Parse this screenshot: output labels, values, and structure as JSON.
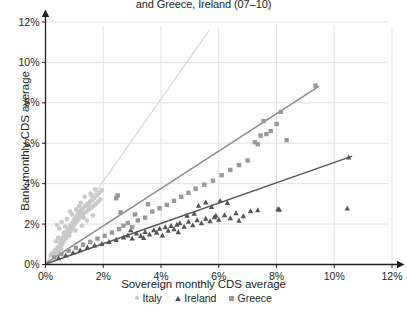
{
  "chart_data": {
    "type": "scatter",
    "title": "and Greece, Ireland (07–10)",
    "xlabel": "Sovereign monthly CDS average",
    "ylabel": "Bank monthly CDS average",
    "xlim": [
      0,
      12
    ],
    "ylim": [
      0,
      12
    ],
    "xticks": [
      "0%",
      "2%",
      "4%",
      "6%",
      "8%",
      "10%",
      "12%"
    ],
    "yticks": [
      "0%",
      "2%",
      "4%",
      "6%",
      "8%",
      "10%",
      "12%"
    ],
    "xtick_values": [
      0,
      2,
      4,
      6,
      8,
      10,
      12
    ],
    "ytick_values": [
      0,
      2,
      4,
      6,
      8,
      10,
      12
    ],
    "grid": true,
    "legend_position": "bottom",
    "axis_arrows": true,
    "colors": {
      "italy": "#c9c9c9",
      "ireland": "#555555",
      "greece": "#999999",
      "grid": "#e3e3e3",
      "axis": "#231f20",
      "text": "#231f20"
    },
    "series": [
      {
        "name": "Italy",
        "marker": "circle",
        "color": "#c9c9c9",
        "points": [
          [
            0.18,
            0.45
          ],
          [
            0.22,
            0.55
          ],
          [
            0.28,
            0.62
          ],
          [
            0.3,
            0.48
          ],
          [
            0.34,
            0.72
          ],
          [
            0.38,
            0.6
          ],
          [
            0.42,
            0.85
          ],
          [
            0.45,
            0.7
          ],
          [
            0.5,
            1.05
          ],
          [
            0.52,
            0.9
          ],
          [
            0.55,
            1.2
          ],
          [
            0.58,
            1.0
          ],
          [
            0.6,
            1.35
          ],
          [
            0.63,
            1.15
          ],
          [
            0.66,
            1.45
          ],
          [
            0.7,
            1.28
          ],
          [
            0.72,
            1.6
          ],
          [
            0.75,
            1.4
          ],
          [
            0.78,
            1.72
          ],
          [
            0.8,
            1.52
          ],
          [
            0.83,
            1.85
          ],
          [
            0.86,
            1.62
          ],
          [
            0.88,
            1.95
          ],
          [
            0.9,
            1.75
          ],
          [
            0.93,
            2.05
          ],
          [
            0.95,
            1.85
          ],
          [
            0.98,
            2.18
          ],
          [
            1.0,
            1.98
          ],
          [
            1.02,
            2.28
          ],
          [
            1.05,
            2.08
          ],
          [
            1.08,
            2.4
          ],
          [
            1.1,
            2.15
          ],
          [
            1.12,
            2.52
          ],
          [
            1.15,
            2.25
          ],
          [
            1.18,
            2.62
          ],
          [
            1.2,
            2.35
          ],
          [
            1.24,
            2.7
          ],
          [
            1.28,
            2.45
          ],
          [
            1.3,
            2.8
          ],
          [
            1.34,
            2.55
          ],
          [
            1.38,
            2.9
          ],
          [
            1.42,
            2.62
          ],
          [
            1.46,
            3.0
          ],
          [
            1.5,
            2.72
          ],
          [
            1.54,
            3.1
          ],
          [
            1.58,
            2.8
          ],
          [
            1.62,
            3.18
          ],
          [
            1.66,
            2.9
          ],
          [
            1.7,
            3.3
          ],
          [
            1.74,
            3.0
          ],
          [
            1.78,
            3.42
          ],
          [
            1.82,
            3.1
          ],
          [
            1.86,
            3.55
          ],
          [
            1.9,
            3.22
          ],
          [
            1.95,
            3.68
          ],
          [
            0.4,
            1.95
          ],
          [
            0.48,
            1.78
          ],
          [
            0.56,
            2.1
          ],
          [
            0.64,
            1.58
          ],
          [
            0.74,
            2.25
          ],
          [
            0.82,
            1.42
          ],
          [
            0.92,
            2.48
          ],
          [
            1.04,
            1.68
          ],
          [
            1.16,
            2.88
          ],
          [
            1.26,
            1.92
          ],
          [
            1.36,
            3.35
          ],
          [
            1.44,
            2.18
          ],
          [
            1.56,
            3.5
          ],
          [
            1.64,
            2.42
          ],
          [
            1.72,
            3.72
          ],
          [
            0.36,
            1.15
          ],
          [
            0.44,
            1.32
          ],
          [
            0.54,
            0.78
          ],
          [
            0.68,
            1.88
          ],
          [
            0.85,
            2.62
          ],
          [
            1.06,
            2.72
          ],
          [
            1.22,
            3.05
          ],
          [
            1.32,
            2.32
          ],
          [
            1.48,
            2.95
          ],
          [
            1.6,
            3.42
          ]
        ]
      },
      {
        "name": "Ireland",
        "marker": "triangle",
        "color": "#555555",
        "points": [
          [
            0.45,
            0.32
          ],
          [
            0.7,
            0.45
          ],
          [
            0.95,
            0.58
          ],
          [
            1.2,
            0.72
          ],
          [
            1.45,
            0.85
          ],
          [
            1.7,
            0.95
          ],
          [
            1.95,
            1.02
          ],
          [
            2.2,
            1.12
          ],
          [
            2.45,
            1.22
          ],
          [
            2.7,
            1.35
          ],
          [
            2.85,
            1.45
          ],
          [
            3.0,
            1.3
          ],
          [
            3.15,
            1.55
          ],
          [
            3.3,
            1.42
          ],
          [
            3.45,
            1.62
          ],
          [
            3.6,
            1.5
          ],
          [
            3.75,
            1.7
          ],
          [
            3.85,
            1.58
          ],
          [
            3.95,
            1.78
          ],
          [
            4.05,
            1.45
          ],
          [
            4.15,
            1.85
          ],
          [
            4.25,
            1.68
          ],
          [
            4.35,
            1.92
          ],
          [
            4.45,
            1.75
          ],
          [
            4.55,
            1.98
          ],
          [
            4.65,
            2.05
          ],
          [
            4.8,
            1.88
          ],
          [
            4.95,
            2.12
          ],
          [
            5.1,
            1.95
          ],
          [
            5.25,
            2.2
          ],
          [
            5.4,
            2.05
          ],
          [
            5.55,
            2.28
          ],
          [
            5.7,
            2.15
          ],
          [
            5.85,
            2.35
          ],
          [
            6.0,
            2.22
          ],
          [
            6.2,
            2.45
          ],
          [
            6.4,
            2.3
          ],
          [
            6.6,
            2.55
          ],
          [
            6.85,
            2.4
          ],
          [
            7.1,
            2.65
          ],
          [
            5.3,
            2.92
          ],
          [
            5.55,
            3.08
          ],
          [
            5.75,
            2.85
          ],
          [
            6.05,
            3.15
          ],
          [
            6.3,
            3.05
          ],
          [
            5.9,
            2.42
          ],
          [
            6.7,
            2.18
          ],
          [
            7.35,
            2.7
          ],
          [
            8.1,
            2.72
          ],
          [
            10.45,
            2.78
          ],
          [
            2.95,
            1.7
          ],
          [
            3.4,
            1.32
          ],
          [
            4.6,
            1.6
          ],
          [
            4.9,
            2.42
          ],
          [
            5.15,
            2.52
          ],
          [
            10.5,
            5.3
          ],
          [
            8.05,
            2.75
          ]
        ]
      },
      {
        "name": "Greece",
        "marker": "square",
        "color": "#999999",
        "points": [
          [
            0.3,
            0.35
          ],
          [
            0.55,
            0.52
          ],
          [
            0.8,
            0.68
          ],
          [
            1.05,
            0.82
          ],
          [
            1.3,
            0.98
          ],
          [
            1.55,
            1.12
          ],
          [
            1.8,
            1.28
          ],
          [
            2.05,
            1.42
          ],
          [
            2.3,
            1.58
          ],
          [
            2.55,
            1.75
          ],
          [
            2.7,
            1.92
          ],
          [
            2.85,
            2.05
          ],
          [
            3.0,
            1.85
          ],
          [
            3.2,
            2.18
          ],
          [
            3.45,
            2.32
          ],
          [
            3.7,
            2.62
          ],
          [
            3.95,
            2.78
          ],
          [
            4.2,
            2.95
          ],
          [
            4.45,
            3.15
          ],
          [
            4.7,
            3.35
          ],
          [
            2.6,
            2.58
          ],
          [
            2.45,
            3.28
          ],
          [
            2.5,
            3.42
          ],
          [
            3.1,
            2.48
          ],
          [
            3.55,
            2.98
          ],
          [
            4.95,
            3.55
          ],
          [
            5.2,
            3.75
          ],
          [
            5.5,
            3.95
          ],
          [
            5.8,
            4.15
          ],
          [
            6.1,
            4.42
          ],
          [
            6.4,
            4.68
          ],
          [
            6.7,
            4.92
          ],
          [
            7.0,
            5.15
          ],
          [
            7.25,
            6.05
          ],
          [
            7.45,
            6.38
          ],
          [
            7.55,
            7.1
          ],
          [
            7.8,
            6.6
          ],
          [
            8.0,
            6.95
          ],
          [
            8.15,
            7.55
          ],
          [
            8.35,
            6.15
          ],
          [
            9.35,
            8.85
          ],
          [
            7.35,
            5.95
          ],
          [
            7.65,
            6.45
          ]
        ]
      }
    ],
    "trendlines": [
      {
        "name": "Italy",
        "color": "#d8d8d8",
        "x0": 0.05,
        "y0": 0.15,
        "x1": 5.65,
        "y1": 11.55
      },
      {
        "name": "Greece",
        "color": "#8a8a8a",
        "x0": 0.05,
        "y0": 0.1,
        "x1": 9.45,
        "y1": 8.8
      },
      {
        "name": "Ireland",
        "color": "#555555",
        "x0": 0.05,
        "y0": 0.05,
        "x1": 10.6,
        "y1": 5.35
      }
    ],
    "legend": [
      {
        "label": "Italy",
        "marker": "circle",
        "color": "#c9c9c9"
      },
      {
        "label": "Ireland",
        "marker": "triangle",
        "color": "#555555"
      },
      {
        "label": "Greece",
        "marker": "square",
        "color": "#999999"
      }
    ]
  }
}
